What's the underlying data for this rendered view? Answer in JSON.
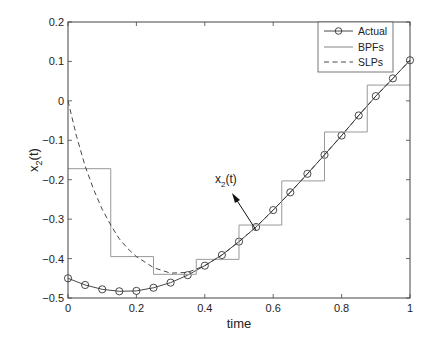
{
  "chart_data": {
    "type": "line",
    "title": "",
    "xlabel": "time",
    "ylabel": "x_2(t)",
    "xlim": [
      0,
      1
    ],
    "ylim": [
      -0.5,
      0.2
    ],
    "grid": false,
    "legend_position": "upper right",
    "x_ticks": [
      0,
      0.2,
      0.4,
      0.6,
      0.8,
      1
    ],
    "x_tick_labels": [
      "0",
      "0.2",
      "0.4",
      "0.6",
      "0.8",
      "1"
    ],
    "y_ticks": [
      0.2,
      0.1,
      0,
      -0.1,
      -0.2,
      -0.3,
      -0.4,
      -0.5
    ],
    "y_tick_labels": [
      "0.2",
      "0.1",
      "0",
      "−0.1",
      "−0.2",
      "−0.3",
      "−0.4",
      "−0.5"
    ],
    "annotation": {
      "text": "x_2(t)",
      "arrow_from": [
        0.55,
        -0.33
      ],
      "arrow_to": [
        0.485,
        -0.24
      ],
      "text_pos": [
        0.44,
        -0.2
      ]
    },
    "series": [
      {
        "name": "Actual",
        "style": "solid-circle-markers",
        "x": [
          0,
          0.05,
          0.1,
          0.15,
          0.2,
          0.25,
          0.3,
          0.35,
          0.4,
          0.45,
          0.5,
          0.55,
          0.6,
          0.65,
          0.7,
          0.75,
          0.8,
          0.85,
          0.9,
          0.95,
          1.0
        ],
        "values": [
          -0.45,
          -0.467,
          -0.478,
          -0.483,
          -0.482,
          -0.474,
          -0.461,
          -0.442,
          -0.418,
          -0.391,
          -0.357,
          -0.32,
          -0.277,
          -0.232,
          -0.185,
          -0.137,
          -0.088,
          -0.037,
          0.012,
          0.057,
          0.103
        ]
      },
      {
        "name": "BPFs",
        "style": "step",
        "edges": [
          0,
          0.125,
          0.25,
          0.375,
          0.5,
          0.625,
          0.75,
          0.875,
          1.0
        ],
        "values": [
          -0.172,
          -0.395,
          -0.44,
          -0.402,
          -0.315,
          -0.203,
          -0.079,
          0.04
        ]
      },
      {
        "name": "SLPs",
        "style": "dashed",
        "x": [
          0,
          0.025,
          0.05,
          0.075,
          0.1,
          0.125,
          0.15,
          0.175,
          0.2,
          0.25,
          0.3,
          0.35,
          0.4,
          0.45,
          0.5,
          0.55,
          0.6,
          0.65,
          0.7,
          0.75,
          0.8,
          0.85,
          0.9,
          0.95,
          1.0
        ],
        "values": [
          0.0,
          -0.09,
          -0.165,
          -0.225,
          -0.275,
          -0.315,
          -0.35,
          -0.375,
          -0.395,
          -0.423,
          -0.437,
          -0.435,
          -0.418,
          -0.391,
          -0.357,
          -0.32,
          -0.277,
          -0.232,
          -0.185,
          -0.137,
          -0.088,
          -0.037,
          0.012,
          0.057,
          0.103
        ]
      }
    ]
  },
  "legend": {
    "items": [
      {
        "label": "Actual"
      },
      {
        "label": "BPFs"
      },
      {
        "label": "SLPs"
      }
    ]
  },
  "axes": {
    "xlabel": "time",
    "ylabel_main": "x",
    "ylabel_sub": "2",
    "ylabel_tail": "(t)"
  },
  "annotation": {
    "main": "x",
    "sub": "2",
    "tail": "(t)"
  }
}
